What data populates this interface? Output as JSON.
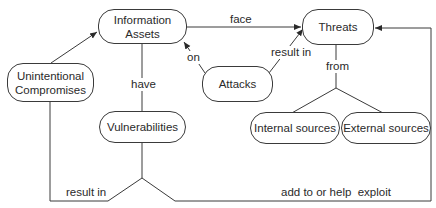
{
  "diagram": {
    "type": "concept-map",
    "nodes": {
      "info_assets": {
        "label_line1": "Information",
        "label_line2": "Assets"
      },
      "threats": {
        "label": "Threats"
      },
      "attacks": {
        "label": "Attacks"
      },
      "unintentional": {
        "label_line1": "Unintentional",
        "label_line2": "Compromises"
      },
      "vulnerabilities": {
        "label": "Vulnerabilities"
      },
      "internal": {
        "label": "Internal sources"
      },
      "external": {
        "label": "External sources"
      }
    },
    "edges": {
      "face": "face",
      "on": "on",
      "attacks_result_in": "result in",
      "have": "have",
      "from": "from",
      "vuln_result_in": "result in",
      "add_exploit": "add to or help  exploit"
    },
    "relations": [
      {
        "from": "Information Assets",
        "to": "Threats",
        "label": "face"
      },
      {
        "from": "Attacks",
        "to": "Information Assets",
        "label": "on"
      },
      {
        "from": "Attacks",
        "to": "Threats",
        "label": "result in"
      },
      {
        "from": "Unintentional Compromises",
        "to": "Information Assets",
        "label": ""
      },
      {
        "from": "Information Assets",
        "to": "Vulnerabilities",
        "label": "have"
      },
      {
        "from": "Threats",
        "to": [
          "Internal sources",
          "External sources"
        ],
        "label": "from"
      },
      {
        "from": "Vulnerabilities",
        "to": "Unintentional Compromises",
        "label": "result in"
      },
      {
        "from": "Vulnerabilities",
        "to": "Threats",
        "label": "add to or help exploit"
      }
    ],
    "colors": {
      "line": "#3a3a3a",
      "text": "#2a2a2a",
      "background": "#ffffff"
    }
  }
}
